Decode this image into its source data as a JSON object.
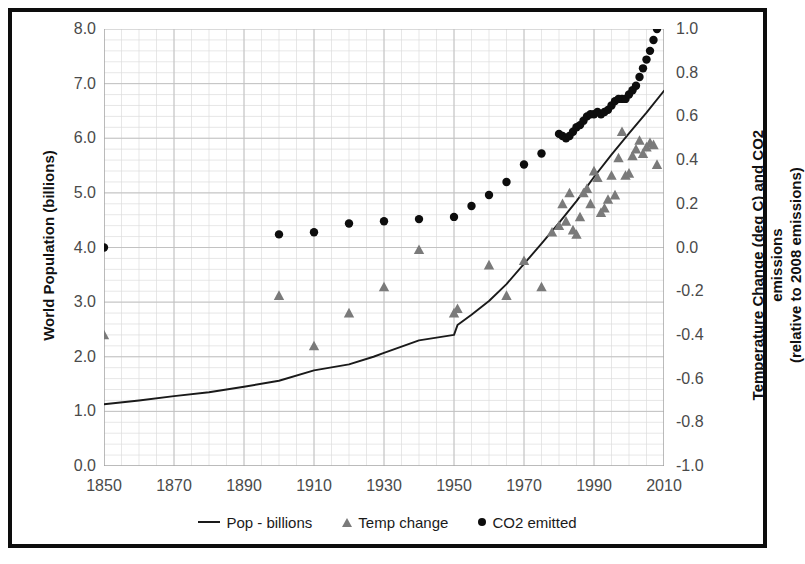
{
  "chart_data": {
    "type": "scatter",
    "title": "",
    "xlabel": "",
    "ylabel": "World Population (billions)",
    "y2label_line1": "Temperature Change (deg C) and CO2 emissions",
    "y2label_line2": "(relative to 2008 emissions)",
    "xlim": [
      1850,
      2010
    ],
    "ylim": [
      0.0,
      8.0
    ],
    "y2lim": [
      -1.0,
      1.0
    ],
    "grid": true,
    "minor_grid": true,
    "legend_position": "bottom",
    "xticks": [
      "1850",
      "1870",
      "1890",
      "1910",
      "1930",
      "1950",
      "1970",
      "1990",
      "2010"
    ],
    "xtick_values": [
      1850,
      1870,
      1890,
      1910,
      1930,
      1950,
      1970,
      1990,
      2010
    ],
    "yticks": [
      "0.0",
      "1.0",
      "2.0",
      "3.0",
      "4.0",
      "5.0",
      "6.0",
      "7.0",
      "8.0"
    ],
    "ytick_values": [
      0.0,
      1.0,
      2.0,
      3.0,
      4.0,
      5.0,
      6.0,
      7.0,
      8.0
    ],
    "y2ticks": [
      "-1.0",
      "-0.8",
      "-0.6",
      "-0.4",
      "-0.2",
      "0.0",
      "0.2",
      "0.4",
      "0.6",
      "0.8",
      "1.0"
    ],
    "y2tick_values": [
      -1.0,
      -0.8,
      -0.6,
      -0.4,
      -0.2,
      0.0,
      0.2,
      0.4,
      0.6,
      0.8,
      1.0
    ],
    "series": [
      {
        "name": "Pop - billions",
        "type": "line",
        "axis": "left",
        "color": "#1a1a1a",
        "x": [
          1850,
          1860,
          1870,
          1880,
          1890,
          1900,
          1910,
          1920,
          1927,
          1930,
          1940,
          1950,
          1951,
          1955,
          1960,
          1965,
          1970,
          1975,
          1980,
          1985,
          1990,
          1995,
          2000,
          2005,
          2010
        ],
        "values": [
          1.13,
          1.2,
          1.28,
          1.35,
          1.45,
          1.56,
          1.75,
          1.86,
          2.0,
          2.07,
          2.3,
          2.4,
          2.58,
          2.77,
          3.02,
          3.33,
          3.7,
          4.07,
          4.45,
          4.85,
          5.29,
          5.7,
          6.09,
          6.47,
          6.87
        ],
        "legend_marker": "line"
      },
      {
        "name": "Temp change",
        "type": "scatter",
        "axis": "right",
        "color": "#7a7a7a",
        "marker": "triangle",
        "x": [
          1850,
          1900,
          1910,
          1920,
          1930,
          1940,
          1950,
          1951,
          1960,
          1965,
          1970,
          1975,
          1978,
          1980,
          1981,
          1982,
          1983,
          1984,
          1985,
          1986,
          1987,
          1988,
          1989,
          1990,
          1991,
          1992,
          1993,
          1994,
          1995,
          1996,
          1997,
          1998,
          1999,
          2000,
          2001,
          2002,
          2003,
          2004,
          2005,
          2006,
          2007,
          2008
        ],
        "values": [
          -0.4,
          -0.22,
          -0.45,
          -0.3,
          -0.18,
          -0.01,
          -0.3,
          -0.28,
          -0.08,
          -0.22,
          -0.06,
          -0.18,
          0.07,
          0.1,
          0.2,
          0.12,
          0.25,
          0.08,
          0.06,
          0.14,
          0.25,
          0.27,
          0.2,
          0.35,
          0.32,
          0.16,
          0.18,
          0.22,
          0.33,
          0.24,
          0.41,
          0.53,
          0.33,
          0.34,
          0.42,
          0.45,
          0.49,
          0.43,
          0.46,
          0.48,
          0.47,
          0.38
        ],
        "legend_marker": "triangle"
      },
      {
        "name": "CO2 emitted",
        "type": "scatter",
        "axis": "right",
        "color": "#0d0d0d",
        "marker": "circle",
        "x": [
          1850,
          1900,
          1910,
          1920,
          1930,
          1940,
          1950,
          1955,
          1960,
          1965,
          1970,
          1975,
          1980,
          1981,
          1982,
          1983,
          1984,
          1985,
          1986,
          1987,
          1988,
          1989,
          1990,
          1991,
          1992,
          1993,
          1994,
          1995,
          1996,
          1997,
          1998,
          1999,
          2000,
          2001,
          2002,
          2003,
          2004,
          2005,
          2006,
          2007,
          2008
        ],
        "values": [
          0.0,
          0.06,
          0.07,
          0.11,
          0.12,
          0.13,
          0.14,
          0.19,
          0.24,
          0.3,
          0.38,
          0.43,
          0.52,
          0.51,
          0.5,
          0.51,
          0.53,
          0.55,
          0.56,
          0.58,
          0.6,
          0.61,
          0.61,
          0.62,
          0.61,
          0.62,
          0.63,
          0.65,
          0.67,
          0.68,
          0.68,
          0.68,
          0.7,
          0.72,
          0.74,
          0.78,
          0.82,
          0.86,
          0.9,
          0.95,
          1.0
        ],
        "legend_marker": "circle"
      }
    ]
  },
  "legend": {
    "items": [
      {
        "label": "Pop - billions",
        "marker": "line"
      },
      {
        "label": "Temp change",
        "marker": "triangle"
      },
      {
        "label": "CO2 emitted",
        "marker": "circle"
      }
    ]
  }
}
